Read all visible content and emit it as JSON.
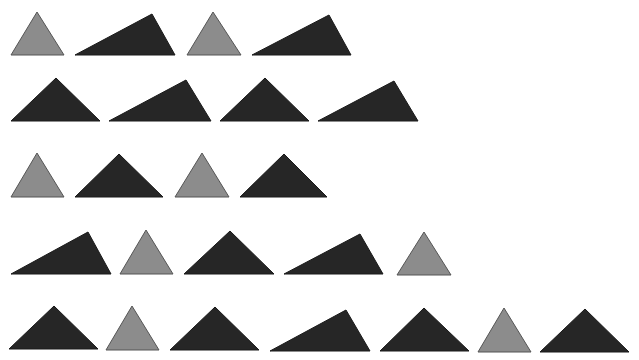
{
  "colors": {
    "background": "#ffffff",
    "gray_fill": "#8c8c8c",
    "gray_stroke": "#555555",
    "dark_fill": "#262626",
    "dark_stroke": "#1a1a1a"
  },
  "rows": [
    {
      "row": 1,
      "triangles": [
        {
          "kind": "gray",
          "shape": "equilateral",
          "points": [
            [
              11,
              55
            ],
            [
              37,
              12
            ],
            [
              64,
              55
            ]
          ]
        },
        {
          "kind": "dark",
          "shape": "scalene",
          "points": [
            [
              75,
              55
            ],
            [
              152,
              14
            ],
            [
              175,
              55
            ]
          ]
        },
        {
          "kind": "gray",
          "shape": "equilateral",
          "points": [
            [
              187,
              55
            ],
            [
              213,
              12
            ],
            [
              241,
              55
            ]
          ]
        },
        {
          "kind": "dark",
          "shape": "scalene",
          "points": [
            [
              252,
              55
            ],
            [
              329,
              15
            ],
            [
              351,
              55
            ]
          ]
        }
      ]
    },
    {
      "row": 2,
      "triangles": [
        {
          "kind": "dark",
          "shape": "isosceles-right",
          "points": [
            [
              11,
              121
            ],
            [
              56,
              78
            ],
            [
              100,
              121
            ]
          ]
        },
        {
          "kind": "dark",
          "shape": "scalene",
          "points": [
            [
              109,
              121
            ],
            [
              186,
              80
            ],
            [
              211,
              121
            ]
          ]
        },
        {
          "kind": "dark",
          "shape": "isosceles-right",
          "points": [
            [
              220,
              121
            ],
            [
              265,
              78
            ],
            [
              309,
              121
            ]
          ]
        },
        {
          "kind": "dark",
          "shape": "scalene",
          "points": [
            [
              318,
              121
            ],
            [
              394,
              81
            ],
            [
              418,
              121
            ]
          ]
        }
      ]
    },
    {
      "row": 3,
      "triangles": [
        {
          "kind": "gray",
          "shape": "equilateral",
          "points": [
            [
              11,
              197
            ],
            [
              37,
              153
            ],
            [
              64,
              197
            ]
          ]
        },
        {
          "kind": "dark",
          "shape": "isosceles-right",
          "points": [
            [
              75,
              197
            ],
            [
              119,
              154
            ],
            [
              163,
              197
            ]
          ]
        },
        {
          "kind": "gray",
          "shape": "equilateral",
          "points": [
            [
              175,
              197
            ],
            [
              202,
              153
            ],
            [
              229,
              197
            ]
          ]
        },
        {
          "kind": "dark",
          "shape": "isosceles-right",
          "points": [
            [
              240,
              197
            ],
            [
              284,
              154
            ],
            [
              327,
              197
            ]
          ]
        }
      ]
    },
    {
      "row": 4,
      "triangles": [
        {
          "kind": "dark",
          "shape": "scalene",
          "points": [
            [
              11,
              274
            ],
            [
              88,
              232
            ],
            [
              111,
              274
            ]
          ]
        },
        {
          "kind": "gray",
          "shape": "equilateral",
          "points": [
            [
              120,
              274
            ],
            [
              146,
              230
            ],
            [
              173,
              274
            ]
          ]
        },
        {
          "kind": "dark",
          "shape": "isosceles-right",
          "points": [
            [
              184,
              274
            ],
            [
              230,
              231
            ],
            [
              274,
              274
            ]
          ]
        },
        {
          "kind": "dark",
          "shape": "scalene",
          "points": [
            [
              284,
              274
            ],
            [
              360,
              234
            ],
            [
              383,
              274
            ]
          ]
        },
        {
          "kind": "gray",
          "shape": "equilateral",
          "points": [
            [
              397,
              275
            ],
            [
              424,
              232
            ],
            [
              451,
              275
            ]
          ]
        }
      ]
    },
    {
      "row": 5,
      "triangles": [
        {
          "kind": "dark",
          "shape": "isosceles-right",
          "points": [
            [
              9,
              349
            ],
            [
              54,
              306
            ],
            [
              98,
              349
            ]
          ]
        },
        {
          "kind": "gray",
          "shape": "equilateral",
          "points": [
            [
              106,
              350
            ],
            [
              132,
              306
            ],
            [
              159,
              350
            ]
          ]
        },
        {
          "kind": "dark",
          "shape": "isosceles-right",
          "points": [
            [
              170,
              350
            ],
            [
              215,
              307
            ],
            [
              259,
              350
            ]
          ]
        },
        {
          "kind": "dark",
          "shape": "scalene",
          "points": [
            [
              270,
              351
            ],
            [
              346,
              310
            ],
            [
              370,
              351
            ]
          ]
        },
        {
          "kind": "dark",
          "shape": "isosceles-right",
          "points": [
            [
              380,
              351
            ],
            [
              424,
              308
            ],
            [
              469,
              351
            ]
          ]
        },
        {
          "kind": "gray",
          "shape": "equilateral",
          "points": [
            [
              478,
              352
            ],
            [
              504,
              308
            ],
            [
              531,
              352
            ]
          ]
        },
        {
          "kind": "dark",
          "shape": "isosceles-right",
          "points": [
            [
              540,
              352
            ],
            [
              585,
              309
            ],
            [
              629,
              352
            ]
          ]
        }
      ]
    }
  ],
  "counts": {
    "total": 24,
    "gray": 8,
    "dark": 16
  }
}
